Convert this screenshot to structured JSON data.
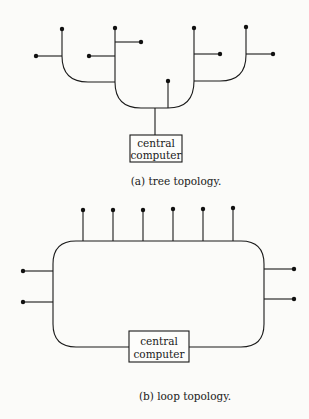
{
  "figure_a": {
    "box_label_line1": "central",
    "box_label_line2": "computer",
    "caption": "(a) tree topology."
  },
  "figure_b": {
    "box_label_line1": "central",
    "box_label_line2": "computer",
    "caption": "(b) loop topology."
  },
  "colors": {
    "ink": "#1a1a1a",
    "paper": "#fbfbf9"
  }
}
